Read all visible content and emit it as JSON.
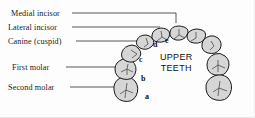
{
  "figure": {
    "caption_line1": "UPPER",
    "caption_line2": "TEETH",
    "background_color": "#fdfdfd",
    "tooth_fill": "#d6d6d6",
    "tooth_outline": "#1a1a1a",
    "leader_color": "#2b2b2b"
  },
  "labels": [
    {
      "id": "medial-incisor",
      "text": "Medial incisor"
    },
    {
      "id": "lateral-incisor",
      "text": "Lateral incisor"
    },
    {
      "id": "canine",
      "text": "Canine (cuspid)"
    },
    {
      "id": "first-molar",
      "text": "First molar"
    },
    {
      "id": "second-molar",
      "text": "Second molar"
    }
  ],
  "keys": [
    {
      "id": "a",
      "text": "a",
      "refers_to": "Second molar"
    },
    {
      "id": "b",
      "text": "b",
      "refers_to": "First molar"
    },
    {
      "id": "c",
      "text": "c",
      "refers_to": "Canine (cuspid)"
    },
    {
      "id": "d",
      "text": "d",
      "refers_to": "Lateral incisor"
    },
    {
      "id": "e",
      "text": "e",
      "refers_to": "Medial incisor"
    }
  ]
}
